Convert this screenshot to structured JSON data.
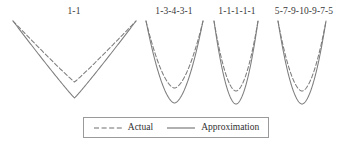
{
  "figure": {
    "background_color": "#ffffff",
    "line_color": "#7d7d7d",
    "legend_border_color": "#9a9a9a"
  },
  "chart_data": {
    "type": "line",
    "title": "",
    "subtitle": "",
    "xlabel": "",
    "ylabel": "",
    "grid": false,
    "axes_visible": false,
    "legend_position": "bottom-center",
    "legend": [
      {
        "name": "Actual",
        "style": "dashed",
        "color": "#7d7d7d"
      },
      {
        "name": "Approximation",
        "style": "solid",
        "color": "#7d7d7d"
      }
    ],
    "panel_count": 4,
    "panels": [
      {
        "label": "1-1",
        "label_x": 74,
        "label_y": 8,
        "x_left": 13,
        "x_right": 136,
        "y_top": 21,
        "series": [
          {
            "name": "Actual",
            "style": "dashed",
            "min_y": 82,
            "width_factor": 1.0
          },
          {
            "name": "Approximation",
            "style": "solid",
            "min_y": 98,
            "width_factor": 1.0
          }
        ]
      },
      {
        "label": "1-3-4-3-1",
        "label_x": 174,
        "label_y": 8,
        "x_left": 146,
        "x_right": 203,
        "y_top": 21,
        "series": [
          {
            "name": "Actual",
            "style": "dashed",
            "min_y": 88,
            "width_factor": 0.46
          },
          {
            "name": "Approximation",
            "style": "solid",
            "min_y": 103,
            "width_factor": 0.46
          }
        ]
      },
      {
        "label": "1-1-1-1-1",
        "label_x": 237,
        "label_y": 8,
        "x_left": 214,
        "x_right": 258,
        "y_top": 21,
        "series": [
          {
            "name": "Actual",
            "style": "dashed",
            "min_y": 91,
            "width_factor": 0.36
          },
          {
            "name": "Approximation",
            "style": "solid",
            "min_y": 104,
            "width_factor": 0.36
          }
        ]
      },
      {
        "label": "5-7-9-10-9-7-5",
        "label_x": 303,
        "label_y": 8,
        "x_left": 278,
        "x_right": 326,
        "y_top": 21,
        "series": [
          {
            "name": "Actual",
            "style": "dashed",
            "min_y": 91,
            "width_factor": 0.39
          },
          {
            "name": "Approximation",
            "style": "solid",
            "min_y": 104,
            "width_factor": 0.39
          }
        ]
      }
    ]
  },
  "legend": {
    "box": {
      "x": 83,
      "y": 117,
      "width": 186,
      "height": 21
    },
    "entries": [
      {
        "label": "Actual",
        "style": "dashed"
      },
      {
        "label": "Approximation",
        "style": "solid"
      }
    ]
  }
}
